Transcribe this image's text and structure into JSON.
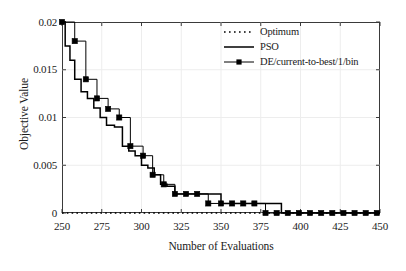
{
  "chart_data": {
    "type": "line",
    "title": "",
    "xlabel": "Number of Evaluations",
    "ylabel": "Objective Value",
    "xlim": [
      250,
      450
    ],
    "ylim": [
      0,
      0.02
    ],
    "xticks": [
      250,
      275,
      300,
      325,
      350,
      375,
      400,
      425,
      450
    ],
    "yticks": [
      0,
      0.005,
      0.01,
      0.015,
      0.02
    ],
    "xtick_labels": [
      "250",
      "275",
      "300",
      "325",
      "350",
      "375",
      "400",
      "425",
      "450"
    ],
    "ytick_labels": [
      "0",
      "0.005",
      "0.01",
      "0.015",
      "0.02"
    ],
    "grid": true,
    "legend_position": "top-right",
    "series": [
      {
        "name": "Optimum",
        "style": "dotted",
        "color": "#000000",
        "x": [
          250,
          450
        ],
        "values": [
          0,
          0
        ]
      },
      {
        "name": "PSO",
        "style": "solid-step",
        "color": "#000000",
        "x": [
          250,
          252,
          252,
          255,
          255,
          258,
          258,
          262,
          262,
          266,
          266,
          270,
          270,
          274,
          274,
          278,
          278,
          283,
          283,
          288,
          288,
          292,
          292,
          296,
          296,
          300,
          300,
          304,
          304,
          308,
          308,
          312,
          312,
          316,
          316,
          321,
          321,
          350,
          350,
          388,
          388,
          450
        ],
        "values": [
          0.02,
          0.02,
          0.0175,
          0.0175,
          0.016,
          0.016,
          0.014,
          0.014,
          0.0127,
          0.0127,
          0.012,
          0.012,
          0.011,
          0.011,
          0.01,
          0.01,
          0.0092,
          0.0092,
          0.009,
          0.009,
          0.007,
          0.007,
          0.0065,
          0.0065,
          0.006,
          0.006,
          0.005,
          0.005,
          0.0047,
          0.0047,
          0.004,
          0.004,
          0.003,
          0.003,
          0.0028,
          0.0028,
          0.002,
          0.002,
          0.001,
          0.001,
          0.0,
          0.0
        ]
      },
      {
        "name": "DE/current-to-best/1/bin",
        "style": "solid-step-markers",
        "color": "#000000",
        "marker": "square",
        "x": [
          250,
          258,
          265,
          272,
          279,
          286,
          293,
          301,
          307,
          314,
          321,
          328,
          335,
          342,
          350,
          357,
          364,
          371,
          378,
          385,
          392,
          399,
          406,
          413,
          420,
          427,
          434,
          441,
          448
        ],
        "values": [
          0.02,
          0.018,
          0.014,
          0.012,
          0.0109,
          0.01,
          0.007,
          0.006,
          0.004,
          0.003,
          0.002,
          0.002,
          0.002,
          0.001,
          0.001,
          0.001,
          0.001,
          0.001,
          0.0,
          0.0,
          0.0,
          0.0,
          0.0,
          0.0,
          0.0,
          0.0,
          0.0,
          0.0,
          0.0
        ]
      }
    ],
    "legend_entries": [
      {
        "label": "Optimum",
        "style": "dotted"
      },
      {
        "label": "PSO",
        "style": "solid"
      },
      {
        "label": "DE/current-to-best/1/bin",
        "style": "solid-marker"
      }
    ]
  }
}
